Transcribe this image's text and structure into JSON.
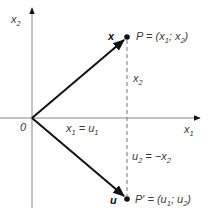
{
  "diagram": {
    "type": "coordinate-reflection",
    "axes": {
      "x_label": "x",
      "x_label_sub": "1",
      "y_label": "x",
      "y_label_sub": "2",
      "origin_label": "0"
    },
    "vectors": [
      {
        "name": "x",
        "label": "x",
        "from": "O",
        "to": "P"
      },
      {
        "name": "u",
        "label": "u",
        "from": "O",
        "to": "P'"
      }
    ],
    "points": {
      "P": {
        "prefix": "P = (x",
        "sub1": "1",
        "mid": "; x",
        "sub2": "2",
        "suffix": ")"
      },
      "P_prime": {
        "prefix": "P′ = (u",
        "sub1": "1",
        "mid": "; u",
        "sub2": "2",
        "suffix": ")"
      }
    },
    "annotations": {
      "x1_eq_u1": {
        "a": "x",
        "a_sub": "1",
        "eq": " = u",
        "b_sub": "1"
      },
      "x2": {
        "a": "x",
        "a_sub": "2"
      },
      "u2_eq_neg_x2": {
        "a": "u",
        "a_sub": "2",
        "eq": " = −x",
        "b_sub": "2"
      }
    },
    "colors": {
      "axis": "#888888",
      "vector": "#111111",
      "dashed": "#777777",
      "text": "#3a3a3a"
    }
  }
}
